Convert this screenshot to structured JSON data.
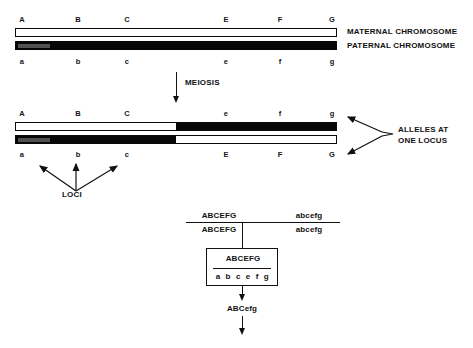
{
  "figure": {
    "colors": {
      "maternal_fill": "#ffffff",
      "paternal_fill": "#070707",
      "stroke": "#0a0a0a",
      "text": "#111111",
      "background": "#ffffff"
    }
  },
  "parental": {
    "maternal_label": "MATERNAL CHROMOSOME",
    "paternal_label": "PATERNAL CHROMOSOME",
    "upper_loci": [
      {
        "label": "A",
        "x": 22,
        "visible": true
      },
      {
        "label": "B",
        "x": 78,
        "visible": true
      },
      {
        "label": "C",
        "x": 127,
        "visible": true
      },
      {
        "label": "D",
        "x": 172,
        "visible": false
      },
      {
        "label": "E",
        "x": 226,
        "visible": true
      },
      {
        "label": "F",
        "x": 280,
        "visible": true
      },
      {
        "label": "G",
        "x": 332,
        "visible": true
      }
    ],
    "lower_loci": [
      {
        "label": "a",
        "x": 22,
        "visible": true
      },
      {
        "label": "b",
        "x": 78,
        "visible": true
      },
      {
        "label": "c",
        "x": 127,
        "visible": true
      },
      {
        "label": "d",
        "x": 172,
        "visible": false
      },
      {
        "label": "e",
        "x": 226,
        "visible": true
      },
      {
        "label": "f",
        "x": 280,
        "visible": true
      },
      {
        "label": "g",
        "x": 332,
        "visible": true
      }
    ]
  },
  "meiosis": {
    "label": "MEIOSIS"
  },
  "recombinant": {
    "alleles_label_line1": "ALLELES AT",
    "alleles_label_line2": "ONE LOCUS",
    "loci_label": "LOCI",
    "upper_loci": [
      {
        "label": "A",
        "x": 22,
        "visible": true
      },
      {
        "label": "B",
        "x": 78,
        "visible": true
      },
      {
        "label": "C",
        "x": 127,
        "visible": true
      },
      {
        "label": "d",
        "x": 172,
        "visible": false
      },
      {
        "label": "e",
        "x": 226,
        "visible": true
      },
      {
        "label": "f",
        "x": 280,
        "visible": true
      },
      {
        "label": "g",
        "x": 332,
        "visible": true
      }
    ],
    "lower_loci": [
      {
        "label": "a",
        "x": 22,
        "visible": true
      },
      {
        "label": "b",
        "x": 78,
        "visible": true
      },
      {
        "label": "c",
        "x": 127,
        "visible": true
      },
      {
        "label": "D",
        "x": 172,
        "visible": false
      },
      {
        "label": "E",
        "x": 226,
        "visible": true
      },
      {
        "label": "F",
        "x": 280,
        "visible": true
      },
      {
        "label": "G",
        "x": 332,
        "visible": true
      }
    ],
    "crossover_fraction": 0.497
  },
  "pedigree": {
    "parent_left": {
      "top": "ABCEFG",
      "bottom": "ABCEFG"
    },
    "parent_right": {
      "top": "abcefg",
      "bottom": "abcefg"
    },
    "offspring_box": {
      "top": "ABCEFG",
      "bottom": "a b c e f g"
    },
    "gamete": "ABCefg"
  }
}
